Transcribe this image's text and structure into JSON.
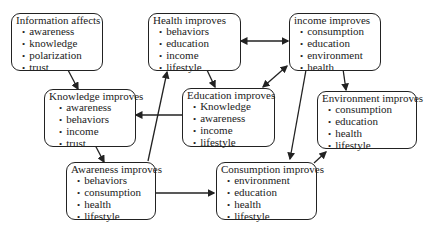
{
  "diagram": {
    "nodes": [
      {
        "id": "information",
        "title": "Information affects",
        "items": [
          "awareness",
          "knowledge",
          "polarization",
          "trust"
        ]
      },
      {
        "id": "health",
        "title": "Health improves",
        "items": [
          "behaviors",
          "education",
          "income",
          "lifestyle"
        ]
      },
      {
        "id": "income",
        "title": "income improves",
        "items": [
          "consumption",
          "education",
          "environment",
          "health"
        ]
      },
      {
        "id": "knowledge",
        "title": "Knowledge improves",
        "items": [
          "awareness",
          "behaviors",
          "income",
          "trust"
        ]
      },
      {
        "id": "education",
        "title": "Education improves",
        "items": [
          "Knowledge",
          "awareness",
          "income",
          "lifestyle"
        ]
      },
      {
        "id": "environment",
        "title": "Environment improves",
        "items": [
          "consumption",
          "education",
          "health",
          "lifestyle"
        ]
      },
      {
        "id": "awareness",
        "title": "Awareness improves",
        "items": [
          "behaviors",
          "consumption",
          "health",
          "lifestyle"
        ]
      },
      {
        "id": "consumption",
        "title": "Consumption improves",
        "items": [
          "environment",
          "education",
          "health",
          "lifestyle"
        ]
      }
    ],
    "edges": [
      {
        "from": "information",
        "to": "knowledge",
        "type": "directed"
      },
      {
        "from": "health",
        "to": "income",
        "type": "bidirectional"
      },
      {
        "from": "health",
        "to": "education",
        "type": "directed"
      },
      {
        "from": "income",
        "to": "education",
        "type": "bidirectional"
      },
      {
        "from": "income",
        "to": "environment",
        "type": "directed"
      },
      {
        "from": "income",
        "to": "consumption",
        "type": "directed"
      },
      {
        "from": "education",
        "to": "knowledge",
        "type": "directed"
      },
      {
        "from": "knowledge",
        "to": "awareness",
        "type": "directed"
      },
      {
        "from": "awareness",
        "to": "health",
        "type": "directed"
      },
      {
        "from": "awareness",
        "to": "consumption",
        "type": "directed"
      },
      {
        "from": "consumption",
        "to": "environment",
        "type": "directed"
      }
    ]
  }
}
